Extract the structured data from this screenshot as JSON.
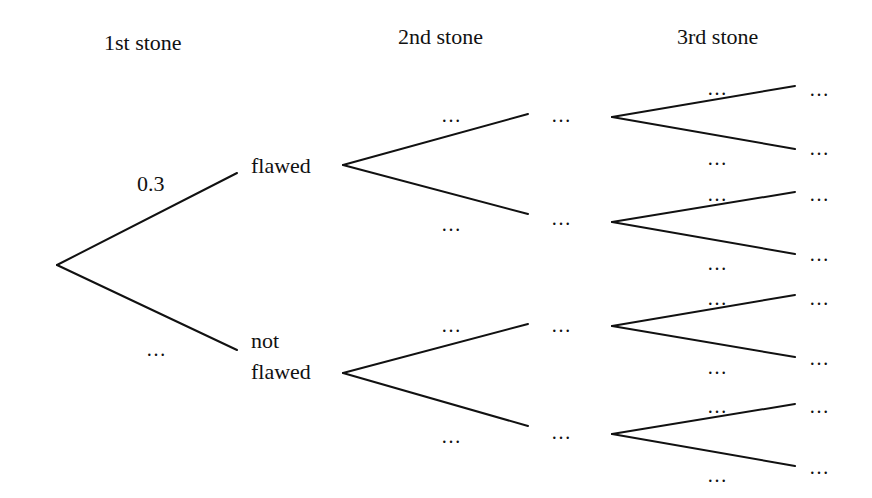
{
  "headers": {
    "first": "1st stone",
    "second": "2nd stone",
    "third": "3rd stone"
  },
  "level1": {
    "top_prob": "0.3",
    "bottom_prob": "…",
    "top_outcome": "flawed",
    "bottom_outcome_line1": "not",
    "bottom_outcome_line2": "flawed"
  },
  "level2": {
    "probs": [
      "…",
      "…",
      "…",
      "…"
    ],
    "outcomes": [
      "…",
      "…",
      "…",
      "…"
    ]
  },
  "level3": {
    "probs": [
      "…",
      "…",
      "…",
      "…",
      "…",
      "…",
      "…",
      "…"
    ],
    "outcomes": [
      "…",
      "…",
      "…",
      "…",
      "…",
      "…",
      "…",
      "…"
    ]
  },
  "colors": {
    "line": "#111111",
    "background": "#ffffff"
  }
}
